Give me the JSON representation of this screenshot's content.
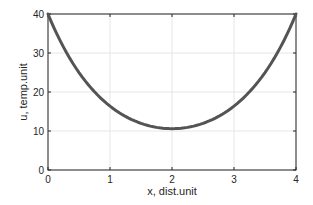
{
  "chart_data": {
    "type": "line",
    "title": "",
    "xlabel": "x, dist.unit",
    "ylabel": "u, temp.unit",
    "xlim": [
      0,
      4
    ],
    "ylim": [
      0,
      40
    ],
    "xticks": [
      "0",
      "1",
      "2",
      "3",
      "4"
    ],
    "yticks": [
      "0",
      "10",
      "20",
      "30",
      "40"
    ],
    "grid": true,
    "legend": null,
    "series": [
      {
        "name": "u(x)",
        "color": "#545454",
        "x": [
          0,
          0.25,
          0.5,
          0.75,
          1,
          1.25,
          1.5,
          1.75,
          2,
          2.25,
          2.5,
          2.75,
          3,
          3.25,
          3.5,
          3.75,
          4
        ],
        "y": [
          40,
          33.7,
          28.6,
          24.5,
          21.3,
          17.3,
          13.9,
          11.6,
          10.6,
          11.6,
          13.9,
          17.3,
          21.3,
          24.5,
          28.6,
          33.7,
          40
        ]
      }
    ]
  },
  "axes": {
    "xlabel": "x, dist.unit",
    "ylabel": "u, temp.unit"
  }
}
